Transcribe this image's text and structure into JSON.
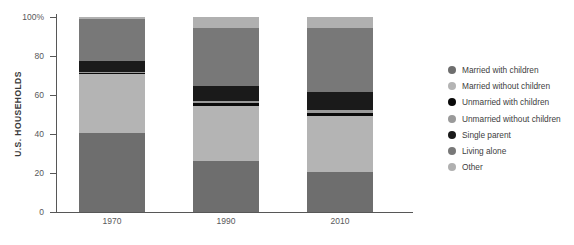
{
  "chart_data": {
    "type": "bar",
    "subtype": "stacked-percentage",
    "title": "",
    "xlabel": "",
    "ylabel": "U.S. HOUSEHOLDS",
    "categories": [
      "1970",
      "1990",
      "2010"
    ],
    "ylim": [
      0,
      100
    ],
    "yticks": [
      0,
      20,
      40,
      60,
      80,
      100
    ],
    "ytick_labels": [
      "0",
      "20",
      "40",
      "60",
      "80",
      "100%"
    ],
    "grid": false,
    "legend_position": "right",
    "stack_order_bottom_to_top": [
      "Married with children",
      "Married without children",
      "Unmarried with children",
      "Unmarried without children",
      "Single parent",
      "Living alone",
      "Other"
    ],
    "series": [
      {
        "name": "Married with children",
        "color": "#6e6e6e",
        "values": [
          40.5,
          26.0,
          20.5
        ]
      },
      {
        "name": "Married without children",
        "color": "#b4b4b4",
        "values": [
          30.5,
          28.5,
          28.5
        ]
      },
      {
        "name": "Unmarried with children",
        "color": "#0a0a0a",
        "values": [
          0.5,
          1.5,
          2.0
        ]
      },
      {
        "name": "Unmarried without children",
        "color": "#9a9a9a",
        "values": [
          0.5,
          1.0,
          1.5
        ]
      },
      {
        "name": "Single parent",
        "color": "#1a1a1a",
        "values": [
          5.5,
          7.5,
          9.0
        ]
      },
      {
        "name": "Living alone",
        "color": "#787878",
        "values": [
          21.5,
          30.0,
          33.0
        ]
      },
      {
        "name": "Other",
        "color": "#b0b0b0",
        "values": [
          1.0,
          5.5,
          5.5
        ]
      }
    ]
  },
  "axis": {
    "y_title": "U.S. HOUSEHOLDS",
    "y_labels": [
      "100%",
      "80",
      "60",
      "40",
      "20",
      "0"
    ],
    "x_labels": [
      "1970",
      "1990",
      "2010"
    ]
  },
  "legend": {
    "items": [
      {
        "label": "Married with children",
        "color": "#6e6e6e"
      },
      {
        "label": "Married without children",
        "color": "#b4b4b4"
      },
      {
        "label": "Unmarried with children",
        "color": "#0a0a0a"
      },
      {
        "label": "Unmarried without children",
        "color": "#9a9a9a"
      },
      {
        "label": "Single parent",
        "color": "#1a1a1a"
      },
      {
        "label": "Living alone",
        "color": "#787878"
      },
      {
        "label": "Other",
        "color": "#b0b0b0"
      }
    ]
  },
  "colors": {
    "axis": "#575757",
    "tick_text": "#58585a",
    "legend_text": "#404040",
    "background": "#ffffff"
  }
}
